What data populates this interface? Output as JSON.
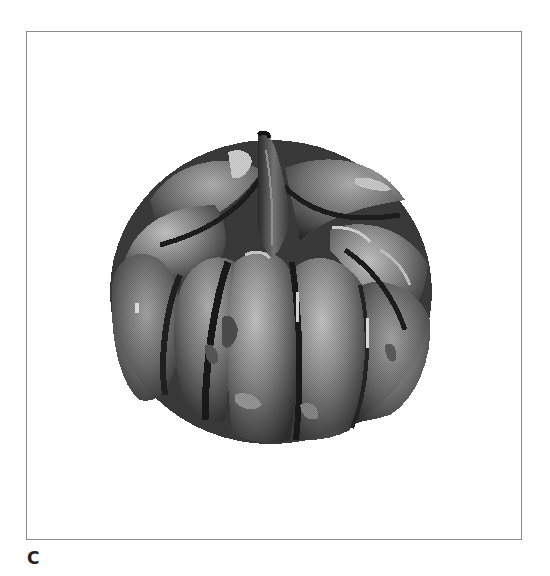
{
  "figure": {
    "panel_label": "C",
    "content": "grayscale pixelated 3D rendering of a pumpkin",
    "colors": {
      "frame_border": "#8a8a8a",
      "background": "#ffffff",
      "label": "#222222",
      "shade_dark": "#2a2a2a",
      "shade_mid": "#6e6e6e",
      "shade_light": "#c8c8c8"
    }
  }
}
